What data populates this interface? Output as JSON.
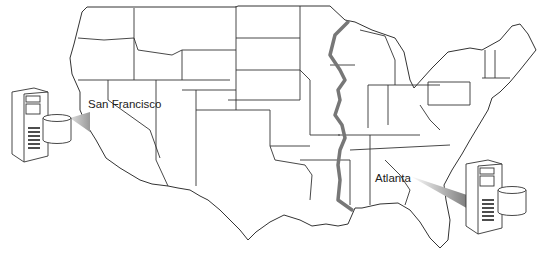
{
  "diagram": {
    "type": "map-with-servers",
    "divider": {
      "name": "Mississippi River",
      "color": "#777777"
    },
    "cities": [
      {
        "name": "San Francisco",
        "x": 89,
        "y": 105
      },
      {
        "name": "Atlanta",
        "x": 375,
        "y": 172
      }
    ],
    "servers": [
      {
        "id": "west-server",
        "linked_city": "San Francisco",
        "x": 8,
        "y": 86
      },
      {
        "id": "east-server",
        "linked_city": "Atlanta",
        "x": 463,
        "y": 162
      }
    ],
    "colors": {
      "outline": "#333333",
      "divider": "#777777",
      "beam": "#9a9a9a",
      "background": "#ffffff"
    }
  }
}
